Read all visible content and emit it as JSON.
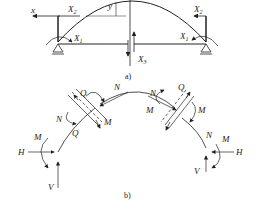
{
  "figure_a": {
    "caption": "a)",
    "labels": {
      "x": "x",
      "X2_left": "X",
      "X2_left_sub": "2",
      "X1_left": "X",
      "X1_left_sub": "1",
      "y": "y",
      "X2_right": "X",
      "X2_right_sub": "2",
      "X1_right": "X",
      "X1_right_sub": "1",
      "X3": "X",
      "X3_sub": "3"
    }
  },
  "figure_b": {
    "caption": "b)",
    "labels": {
      "Q_left_top": "Q",
      "N_left_top": "N",
      "N_left_mid": "N",
      "M_left_mid": "M",
      "Q_left_bot": "Q",
      "M_left": "M",
      "H_left": "H",
      "V_left": "V",
      "Q_right_top": "Q",
      "N_right_top": "N",
      "M_right_top": "M",
      "M_right_mid": "M",
      "N_right_mid": "N",
      "M_right": "M",
      "H_right": "H",
      "V_right": "V"
    }
  },
  "colors": {
    "stroke": "#222222",
    "background": "#ffffff"
  }
}
